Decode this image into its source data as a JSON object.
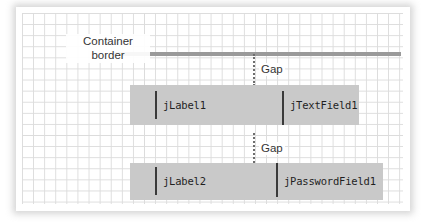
{
  "diagram": {
    "title_annotations": {
      "container_border_label": "Container\nborder",
      "container_border_label_line1": "Container",
      "container_border_label_line2": "border",
      "gap_label_top": "Gap",
      "gap_label_bottom": "Gap"
    },
    "components": [
      {
        "id": "jLabel1",
        "label": "jLabel1",
        "row": 1,
        "column": "left"
      },
      {
        "id": "jTextField1",
        "label": "jTextField1",
        "row": 1,
        "column": "right"
      },
      {
        "id": "jLabel2",
        "label": "jLabel2",
        "row": 2,
        "column": "left"
      },
      {
        "id": "jPasswordField1",
        "label": "jPasswordField1",
        "row": 2,
        "column": "right"
      }
    ],
    "colors": {
      "grid_line": "#dcdcdc",
      "container_border_rule": "#9a9a9a",
      "component_strip": "#c9c9c9",
      "baseline_tick": "#3a3a3a",
      "gap_guide": "#6d6d6d",
      "annotation_text": "#343434",
      "component_text": "#1f1f1f",
      "canvas_background": "#ffffff"
    }
  }
}
